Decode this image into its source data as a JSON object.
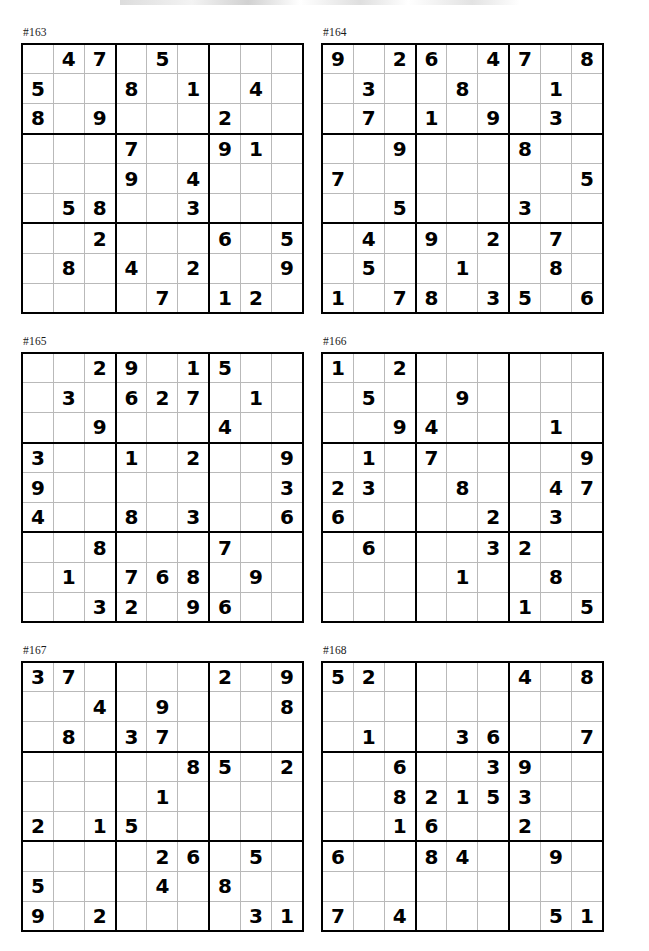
{
  "page": {
    "kind": "sudoku-puzzle-sheet",
    "columns": 2,
    "rows": 3,
    "puzzle_count": 6
  },
  "puzzles": [
    {
      "label": "#163",
      "grid": [
        [
          "",
          "4",
          "7",
          "",
          "5",
          "",
          "",
          "",
          ""
        ],
        [
          "5",
          "",
          "",
          "8",
          "",
          "1",
          "",
          "4",
          ""
        ],
        [
          "8",
          "",
          "9",
          "",
          "",
          "",
          "2",
          "",
          ""
        ],
        [
          "",
          "",
          "",
          "7",
          "",
          "",
          "9",
          "1",
          ""
        ],
        [
          "",
          "",
          "",
          "9",
          "",
          "4",
          "",
          "",
          ""
        ],
        [
          "",
          "5",
          "8",
          "",
          "",
          "3",
          "",
          "",
          ""
        ],
        [
          "",
          "",
          "2",
          "",
          "",
          "",
          "6",
          "",
          "5"
        ],
        [
          "",
          "8",
          "",
          "4",
          "",
          "2",
          "",
          "",
          "9"
        ],
        [
          "",
          "",
          "",
          "",
          "7",
          "",
          "1",
          "2",
          ""
        ]
      ]
    },
    {
      "label": "#164",
      "grid": [
        [
          "9",
          "",
          "2",
          "6",
          "",
          "4",
          "7",
          "",
          "8"
        ],
        [
          "",
          "3",
          "",
          "",
          "8",
          "",
          "",
          "1",
          ""
        ],
        [
          "",
          "7",
          "",
          "1",
          "",
          "9",
          "",
          "3",
          ""
        ],
        [
          "",
          "",
          "9",
          "",
          "",
          "",
          "8",
          "",
          ""
        ],
        [
          "7",
          "",
          "",
          "",
          "",
          "",
          "",
          "",
          "5"
        ],
        [
          "",
          "",
          "5",
          "",
          "",
          "",
          "3",
          "",
          ""
        ],
        [
          "",
          "4",
          "",
          "9",
          "",
          "2",
          "",
          "7",
          ""
        ],
        [
          "",
          "5",
          "",
          "",
          "1",
          "",
          "",
          "8",
          ""
        ],
        [
          "1",
          "",
          "7",
          "8",
          "",
          "3",
          "5",
          "",
          "6"
        ]
      ]
    },
    {
      "label": "#165",
      "grid": [
        [
          "",
          "",
          "2",
          "9",
          "",
          "1",
          "5",
          "",
          ""
        ],
        [
          "",
          "3",
          "",
          "6",
          "2",
          "7",
          "",
          "1",
          ""
        ],
        [
          "",
          "",
          "9",
          "",
          "",
          "",
          "4",
          "",
          ""
        ],
        [
          "3",
          "",
          "",
          "1",
          "",
          "2",
          "",
          "",
          "9"
        ],
        [
          "9",
          "",
          "",
          "",
          "",
          "",
          "",
          "",
          "3"
        ],
        [
          "4",
          "",
          "",
          "8",
          "",
          "3",
          "",
          "",
          "6"
        ],
        [
          "",
          "",
          "8",
          "",
          "",
          "",
          "7",
          "",
          ""
        ],
        [
          "",
          "1",
          "",
          "7",
          "6",
          "8",
          "",
          "9",
          ""
        ],
        [
          "",
          "",
          "3",
          "2",
          "",
          "9",
          "6",
          "",
          ""
        ]
      ]
    },
    {
      "label": "#166",
      "grid": [
        [
          "1",
          "",
          "2",
          "",
          "",
          "",
          "",
          "",
          ""
        ],
        [
          "",
          "5",
          "",
          "",
          "9",
          "",
          "",
          "",
          ""
        ],
        [
          "",
          "",
          "9",
          "4",
          "",
          "",
          "",
          "1",
          ""
        ],
        [
          "",
          "1",
          "",
          "7",
          "",
          "",
          "",
          "",
          "9"
        ],
        [
          "2",
          "3",
          "",
          "",
          "8",
          "",
          "",
          "4",
          "7"
        ],
        [
          "6",
          "",
          "",
          "",
          "",
          "2",
          "",
          "3",
          ""
        ],
        [
          "",
          "6",
          "",
          "",
          "",
          "3",
          "2",
          "",
          ""
        ],
        [
          "",
          "",
          "",
          "",
          "1",
          "",
          "",
          "8",
          ""
        ],
        [
          "",
          "",
          "",
          "",
          "",
          "",
          "1",
          "",
          "5"
        ]
      ]
    },
    {
      "label": "#167",
      "grid": [
        [
          "3",
          "7",
          "",
          "",
          "",
          "",
          "2",
          "",
          "9"
        ],
        [
          "",
          "",
          "4",
          "",
          "9",
          "",
          "",
          "",
          "8"
        ],
        [
          "",
          "8",
          "",
          "3",
          "7",
          "",
          "",
          "",
          ""
        ],
        [
          "",
          "",
          "",
          "",
          "",
          "8",
          "5",
          "",
          "2"
        ],
        [
          "",
          "",
          "",
          "",
          "1",
          "",
          "",
          "",
          ""
        ],
        [
          "2",
          "",
          "1",
          "5",
          "",
          "",
          "",
          "",
          ""
        ],
        [
          "",
          "",
          "",
          "",
          "2",
          "6",
          "",
          "5",
          ""
        ],
        [
          "5",
          "",
          "",
          "",
          "4",
          "",
          "8",
          "",
          ""
        ],
        [
          "9",
          "",
          "2",
          "",
          "",
          "",
          "",
          "3",
          "1"
        ]
      ]
    },
    {
      "label": "#168",
      "grid": [
        [
          "5",
          "2",
          "",
          "",
          "",
          "",
          "4",
          "",
          "8"
        ],
        [
          "",
          "",
          "",
          "",
          "",
          "",
          "",
          "",
          ""
        ],
        [
          "",
          "1",
          "",
          "",
          "3",
          "6",
          "",
          "",
          "7"
        ],
        [
          "",
          "",
          "6",
          "",
          "",
          "3",
          "9",
          "",
          ""
        ],
        [
          "",
          "",
          "8",
          "2",
          "1",
          "5",
          "3",
          "",
          ""
        ],
        [
          "",
          "",
          "1",
          "6",
          "",
          "",
          "2",
          "",
          ""
        ],
        [
          "6",
          "",
          "",
          "8",
          "4",
          "",
          "",
          "9",
          ""
        ],
        [
          "",
          "",
          "",
          "",
          "",
          "",
          "",
          "",
          ""
        ],
        [
          "7",
          "",
          "4",
          "",
          "",
          "",
          "",
          "5",
          "1"
        ]
      ]
    }
  ]
}
